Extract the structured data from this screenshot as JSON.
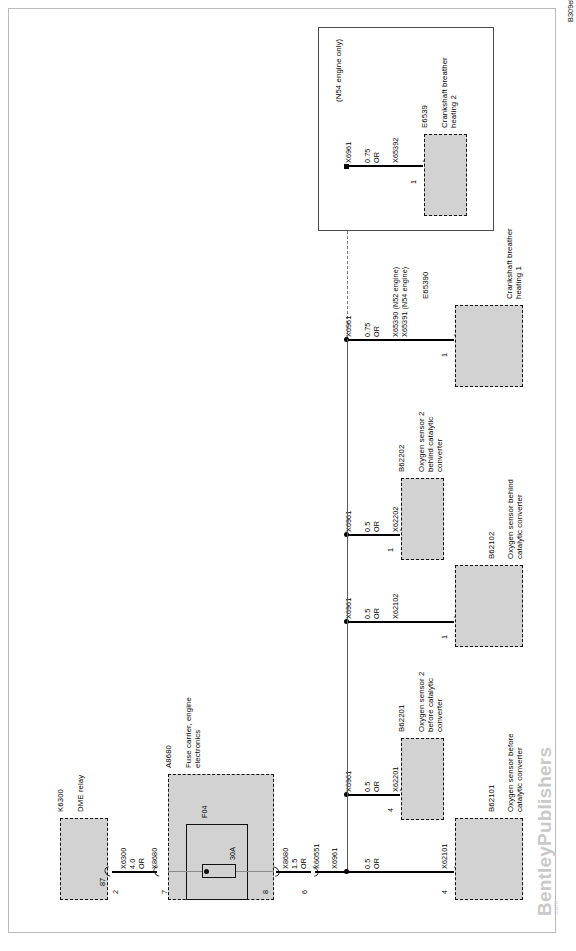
{
  "sheet": {
    "diagram_code": "B309ele24764",
    "watermark": "BentleyPublishers",
    "watermark_sub": ".com",
    "note_n54": "(N54 engine only)"
  },
  "components": [
    {
      "id": "K6300",
      "designation": "K6300",
      "name": "DME relay",
      "pins": [
        "87"
      ]
    },
    {
      "id": "A8680",
      "designation": "A8680",
      "name": "Fuse carrier, engine\nelectronics",
      "fuse_id": "F04",
      "fuse_rating": "30A"
    },
    {
      "id": "E6539",
      "designation": "E6539",
      "name": "Crankshaft breather\nheating 2",
      "pins": [
        "1"
      ]
    },
    {
      "id": "E65390",
      "designation": "E65390",
      "name": "Crankshaft breather\nheating 1",
      "pins": [
        "1"
      ]
    },
    {
      "id": "B62202",
      "designation": "B62202",
      "name": "Oxygen sensor 2\nbehind catalytic\nconverter",
      "pins": [
        "1"
      ]
    },
    {
      "id": "B62102",
      "designation": "B62102",
      "name": "Oxygen sensor behind\ncatalytic converter",
      "pins": [
        "1"
      ]
    },
    {
      "id": "B62201",
      "designation": "B62201",
      "name": "Oxygen sensor 2\nbefore catalytic\nconverter",
      "pins": [
        "4"
      ]
    },
    {
      "id": "B62101",
      "designation": "B62101",
      "name": "Oxygen sensor before\ncatalytic converter",
      "pins": [
        "4"
      ]
    }
  ],
  "connectors": {
    "x6300": "X6300",
    "x8680_a": "X8680",
    "x8680_b": "X8680",
    "x60551": "X60551",
    "x6961_main": "X6961",
    "x6961_b62101": "X6961",
    "x6961_b62201": "X6961",
    "x6961_b62102": "X6961",
    "x6961_b62202": "X6961",
    "x6961_e65390": "X6961",
    "x6961_e6539": "X6961",
    "x62101": "X62101",
    "x62201": "X62201",
    "x62102": "X62102",
    "x62202": "X62202",
    "x65390_n52": "X65390 (N52 engine)",
    "x65391_n54": "X65391 (N54 engine)",
    "x65392": "X65392"
  },
  "pins": {
    "k6300_87": "87",
    "k6300_2": "2",
    "a8680_7": "7",
    "a8680_8": "8",
    "x60551_6": "6",
    "b62101_4": "4",
    "b62201_4": "4",
    "b62102_1": "1",
    "b62202_1": "1",
    "e65390_1": "1",
    "e6539_1": "1"
  },
  "wires": {
    "k6300_to_a8680": {
      "size": "4.0",
      "color": "OR"
    },
    "a8680_to_x60551": {
      "size": "1.5",
      "color": "OR"
    },
    "to_b62101": {
      "size": "0.5",
      "color": "OR"
    },
    "to_b62201": {
      "size": "0.5",
      "color": "OR"
    },
    "to_b62102": {
      "size": "0.5",
      "color": "OR"
    },
    "to_b62202": {
      "size": "0.5",
      "color": "OR"
    },
    "to_e65390": {
      "size": "0.75",
      "color": "OR"
    },
    "to_e6539": {
      "size": "0.75",
      "color": "OR"
    }
  },
  "colors": {
    "component_fill": "#d2d2d2",
    "wire": "#000000",
    "frame": "#b9b9b9",
    "watermark": "#c9c9c9"
  }
}
